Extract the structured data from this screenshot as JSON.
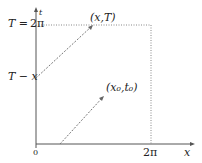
{
  "diagram": {
    "axes": {
      "x_label": "x",
      "t_label": "t",
      "origin_label": "0",
      "x_tick_label": "2π"
    },
    "left_labels": {
      "top": "T = 2π",
      "top_lhs": "T =",
      "top_rhs": "2π",
      "middle": "T − x"
    },
    "points": {
      "upper": "(x,T)",
      "lower": "(x₀,t₀)"
    },
    "colors": {
      "axis": "#444444",
      "dashed": "#777777",
      "text": "#222222"
    }
  }
}
